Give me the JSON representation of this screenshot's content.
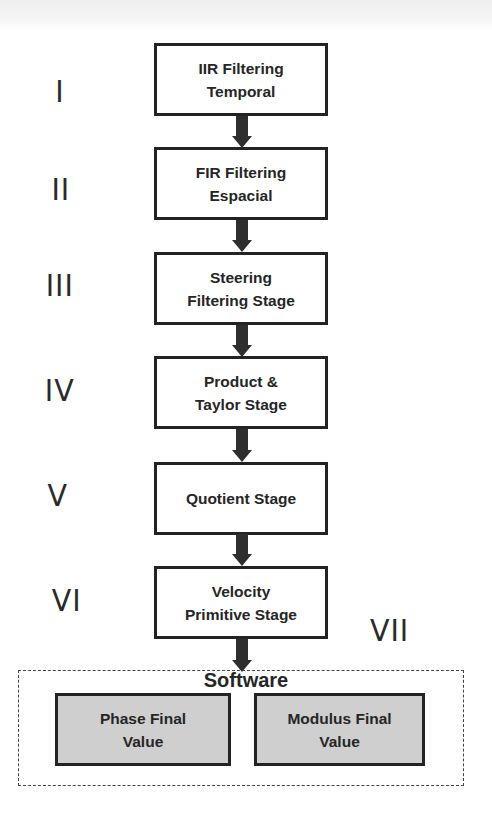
{
  "diagram": {
    "stages": [
      {
        "numeral": "I",
        "label": "IIR Filtering\nTemporal"
      },
      {
        "numeral": "II",
        "label": "FIR Filtering\nEspacial"
      },
      {
        "numeral": "III",
        "label": "Steering\nFiltering Stage"
      },
      {
        "numeral": "IV",
        "label": "Product &\nTaylor Stage"
      },
      {
        "numeral": "V",
        "label": "Quotient Stage"
      },
      {
        "numeral": "VI",
        "label": "Velocity\nPrimitive Stage"
      }
    ],
    "software": {
      "numeral": "VII",
      "title": "Software",
      "outputs": [
        {
          "label": "Phase Final\nValue"
        },
        {
          "label": "Modulus Final\nValue"
        }
      ]
    },
    "colors": {
      "box_border": "#232323",
      "box_fill": "#ffffff",
      "output_fill": "#cfcfcf",
      "arrow": "#2e2e2e",
      "text": "#262626"
    }
  }
}
